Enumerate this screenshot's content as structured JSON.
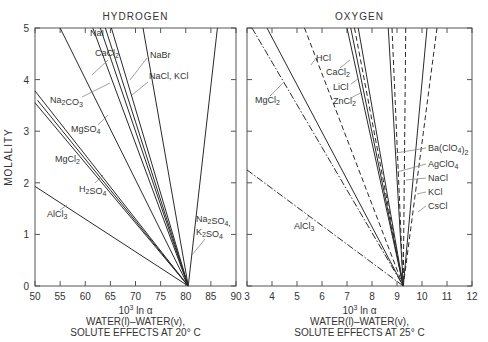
{
  "chart_data": [
    {
      "type": "line",
      "title": "HYDROGEN",
      "xlabel": "10³ ln α",
      "xlabel_line2": "WATER(l)–WATER(v),",
      "xlabel_line3": "SOLUTE EFFECTS AT 20° C",
      "ylabel": "MOLALITY",
      "xlim": [
        50,
        90
      ],
      "ylim": [
        0,
        5
      ],
      "xticks": [
        50,
        55,
        60,
        65,
        70,
        75,
        80,
        85,
        90
      ],
      "yticks": [
        0,
        1,
        2,
        3,
        4,
        5
      ],
      "convergence_point": {
        "x": 80.5,
        "y": 0
      },
      "series": [
        {
          "name": "AlCl3",
          "style": "solid",
          "points": [
            [
              50,
              1.93
            ],
            [
              80.5,
              0
            ]
          ]
        },
        {
          "name": "H2SO4",
          "style": "solid",
          "points": [
            [
              50,
              3.55
            ],
            [
              80.5,
              0
            ]
          ]
        },
        {
          "name": "MgCl2",
          "style": "solid",
          "points": [
            [
              50,
              3.78
            ],
            [
              80.5,
              0
            ]
          ]
        },
        {
          "name": "MgSO4",
          "style": "solid",
          "points": [
            [
              50.5,
              3.6
            ],
            [
              80.5,
              0
            ]
          ]
        },
        {
          "name": "Na2CO3",
          "style": "solid",
          "points": [
            [
              55,
              5
            ],
            [
              80.5,
              0
            ]
          ]
        },
        {
          "name": "NaI",
          "style": "solid",
          "points": [
            [
              61.5,
              5
            ],
            [
              80.5,
              0
            ]
          ]
        },
        {
          "name": "CaCl2",
          "style": "solid",
          "points": [
            [
              63,
              5
            ],
            [
              80.5,
              0
            ]
          ]
        },
        {
          "name": "CaCl2b",
          "style": "solid",
          "points": [
            [
              64,
              5
            ],
            [
              80.5,
              0
            ]
          ]
        },
        {
          "name": "NaBr",
          "style": "solid",
          "points": [
            [
              65.2,
              5
            ],
            [
              80.5,
              0
            ]
          ]
        },
        {
          "name": "NaCl, KCl",
          "style": "solid",
          "points": [
            [
              71.5,
              5
            ],
            [
              80.5,
              0
            ]
          ]
        },
        {
          "name": "Na2SO4, K2SO4",
          "style": "solid",
          "points": [
            [
              86.3,
              5
            ],
            [
              80.5,
              0
            ]
          ]
        }
      ],
      "annotations": [
        "NaI",
        "CaCl2",
        "NaBr",
        "NaCl, KCl",
        "Na2CO3",
        "MgSO4",
        "MgCl2",
        "H2SO4",
        "AlCl3",
        "Na2SO4,",
        "K2SO4"
      ]
    },
    {
      "type": "line",
      "title": "OXYGEN",
      "xlabel": "10³ ln α",
      "xlabel_line2": "WATER(l)–WATER(v),",
      "xlabel_line3": "SOLUTE EFFECTS AT 25° C",
      "ylabel": "MOLALITY",
      "xlim": [
        3,
        12
      ],
      "ylim": [
        0,
        5
      ],
      "xticks": [
        3,
        4,
        5,
        6,
        7,
        8,
        9,
        10,
        11,
        12
      ],
      "yticks": [
        0,
        1,
        2,
        3,
        4,
        5
      ],
      "convergence_point": {
        "x": 9.25,
        "y": 0
      },
      "series": [
        {
          "name": "AlCl3",
          "style": "dashdot",
          "points": [
            [
              3,
              2.25
            ],
            [
              9.25,
              0
            ]
          ]
        },
        {
          "name": "MgCl2",
          "style": "dashdot",
          "points": [
            [
              3.2,
              5
            ],
            [
              9.25,
              0
            ]
          ]
        },
        {
          "name": "MgCl2b",
          "style": "solid",
          "points": [
            [
              3.8,
              5
            ],
            [
              9.25,
              0
            ]
          ]
        },
        {
          "name": "HCl",
          "style": "dashed",
          "points": [
            [
              5.3,
              5
            ],
            [
              9.25,
              0
            ]
          ]
        },
        {
          "name": "CaCl2",
          "style": "solid",
          "points": [
            [
              7.0,
              5
            ],
            [
              9.25,
              0
            ]
          ]
        },
        {
          "name": "LiCl",
          "style": "solid",
          "points": [
            [
              7.15,
              5
            ],
            [
              9.25,
              0
            ]
          ]
        },
        {
          "name": "ZnCl2",
          "style": "dashed",
          "points": [
            [
              7.3,
              5
            ],
            [
              9.25,
              0
            ]
          ]
        },
        {
          "name": "ZnCl2b",
          "style": "solid",
          "points": [
            [
              7.45,
              5
            ],
            [
              9.25,
              0
            ]
          ]
        },
        {
          "name": "Ba(ClO4)2",
          "style": "solid",
          "points": [
            [
              8.65,
              5
            ],
            [
              9.25,
              0
            ]
          ]
        },
        {
          "name": "AgClO4",
          "style": "dashed",
          "points": [
            [
              8.8,
              5
            ],
            [
              9.25,
              0
            ]
          ]
        },
        {
          "name": "NaCl",
          "style": "dashed",
          "points": [
            [
              9.35,
              5
            ],
            [
              9.25,
              0
            ]
          ]
        },
        {
          "name": "KCl",
          "style": "solid",
          "points": [
            [
              10.2,
              5
            ],
            [
              9.25,
              0
            ]
          ]
        },
        {
          "name": "CsCl",
          "style": "dashed",
          "points": [
            [
              10.6,
              5
            ],
            [
              9.25,
              0
            ]
          ]
        }
      ],
      "annotations": [
        "HCl",
        "CaCl2",
        "LiCl",
        "ZnCl2",
        "MgCl2",
        "Ba(ClO4)2",
        "AgClO4",
        "NaCl",
        "KCl",
        "CsCl",
        "AlCl3"
      ]
    }
  ],
  "panels": {
    "left": {
      "title": "HYDROGEN",
      "ylabel": "MOLALITY",
      "xlabel_main": "10",
      "xlabel_sup": "3",
      "xlabel_rest": " ln α",
      "xlabel_line2": "WATER(l)–WATER(v),",
      "xlabel_line3": "SOLUTE EFFECTS AT 20° C",
      "xticks": [
        "50",
        "55",
        "60",
        "65",
        "70",
        "75",
        "80",
        "85",
        "90"
      ],
      "yticks": [
        "0",
        "1",
        "2",
        "3",
        "4",
        "5"
      ]
    },
    "right": {
      "title": "OXYGEN",
      "xlabel_main": "10",
      "xlabel_sup": "3",
      "xlabel_rest": " ln α",
      "xlabel_line2": "WATER(l)–WATER(v),",
      "xlabel_line3": "SOLUTE EFFECTS AT 25° C",
      "xticks": [
        "3",
        "4",
        "5",
        "6",
        "7",
        "8",
        "9",
        "10",
        "11",
        "12"
      ]
    }
  },
  "colors": {
    "line": "#2a2a2a",
    "frame": "#555555",
    "leader": "#888888",
    "text": "#333333"
  }
}
